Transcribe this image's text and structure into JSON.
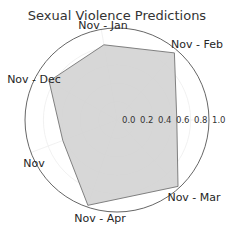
{
  "chart_data": {
    "type": "radar",
    "title": "Sexual Violence Predictions",
    "categories": [
      "Nov - Mar",
      "Nov - Apr",
      "Nov",
      "Nov - Dec",
      "Nov - Jan",
      "Nov - Feb",
      ""
    ],
    "axis_labels_visible": [
      "Nov - Jan",
      "Nov - Feb",
      "Nov - Dec",
      "Nov",
      "Nov - Apr",
      "Nov - Mar"
    ],
    "series": [
      {
        "name": "Predictions",
        "values_by_axis": {
          "Nov - Jan": 0.83,
          "Nov - Feb": 0.96,
          "right_axis": 0.65,
          "Nov - Mar": 0.98,
          "Nov - Apr": 0.98,
          "Nov": 0.63,
          "Nov - Dec": 0.85
        },
        "fill_color": "#d3d3d3",
        "line_color": "#808080"
      }
    ],
    "radial_ticks": [
      "0.0",
      "0.2",
      "0.4",
      "0.6",
      "0.8",
      "1.0"
    ],
    "rlim": [
      0,
      1.0
    ],
    "grid": true,
    "legend": null
  },
  "colors": {
    "fill": "#d3d3d3",
    "edge": "#808080",
    "outer_circle": "#555555",
    "grid": "#eeeeee",
    "text": "#262626"
  }
}
